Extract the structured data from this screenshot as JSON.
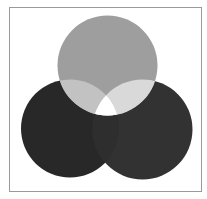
{
  "diagram": {
    "type": "venn",
    "title": "",
    "frame": {
      "x": 9,
      "y": 7,
      "width": 192,
      "height": 184,
      "stroke": "#9a9a9a",
      "fill": "#ffffff"
    },
    "circles": [
      {
        "id": "top",
        "cx": 107.5,
        "cy": 65.5,
        "r": 50,
        "color": "#9e9e9e"
      },
      {
        "id": "bottom-left",
        "cx": 70,
        "cy": 128.5,
        "r": 49,
        "color": "#282828"
      },
      {
        "id": "bottom-right",
        "cx": 142.5,
        "cy": 129.5,
        "r": 50,
        "color": "#323232"
      }
    ],
    "overlaps": {
      "top_and_bottom_left": "#c2c2c2",
      "top_and_bottom_right": "#d9d9d9",
      "bottom_left_and_bottom_right": "#2e2e2e",
      "all_three": "#ffffff"
    },
    "labels": []
  }
}
